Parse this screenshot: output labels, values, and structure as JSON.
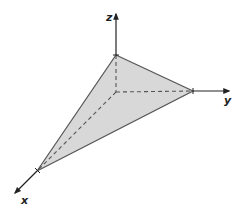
{
  "diagram": {
    "axes": {
      "x": {
        "label": "x"
      },
      "y": {
        "label": "y"
      },
      "z": {
        "label": "z"
      }
    },
    "colors": {
      "fill": "#d8d8d8",
      "edge": "#555555",
      "axis": "#222222",
      "dash": "#555555"
    }
  }
}
